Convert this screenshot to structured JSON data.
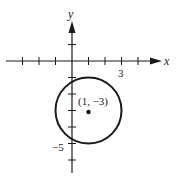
{
  "diagram": {
    "type": "coordinate-plane-circle",
    "x_axis_label": "x",
    "y_axis_label": "y",
    "x_tick_label": "3",
    "y_tick_label": "−5",
    "center_label": "(1, −3)",
    "circle": {
      "center": [
        1,
        -3
      ],
      "radius": 2
    },
    "x_ticks": [
      -3,
      -2,
      -1,
      1,
      2,
      3,
      4
    ],
    "y_ticks": [
      1,
      -1,
      -2,
      -3,
      -4,
      -5,
      -6
    ],
    "colors": {
      "stroke": "#1a1a1a",
      "background": "#ffffff"
    }
  }
}
